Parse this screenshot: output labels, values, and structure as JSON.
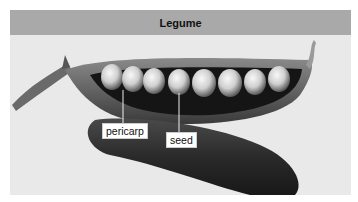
{
  "figure": {
    "title": "Legume",
    "labels": {
      "pericarp": "pericarp",
      "seed": "seed"
    },
    "colors": {
      "header_bg": "#a9a9a9",
      "background": "#e9e9e9",
      "pod_dark": "#2a2a2a",
      "seed_light": "#e0e0e0"
    },
    "seed_count": 8
  }
}
